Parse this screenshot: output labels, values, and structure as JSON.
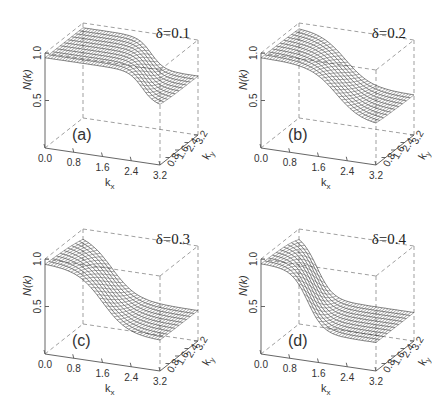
{
  "figure": {
    "panels": [
      {
        "id": "a",
        "label": "(a)",
        "delta": "δ=0.1"
      },
      {
        "id": "b",
        "label": "(b)",
        "delta": "δ=0.2"
      },
      {
        "id": "c",
        "label": "(c)",
        "delta": "δ=0.3"
      },
      {
        "id": "d",
        "label": "(d)",
        "delta": "δ=0.4"
      }
    ],
    "z_axis_label": "N(k)",
    "x_axis_label": "k",
    "x_axis_sub": "x",
    "y_axis_label": "k",
    "y_axis_sub": "y",
    "z_ticks": [
      "1.0",
      "0.5"
    ],
    "x_ticks": [
      "0.0",
      "0.8",
      "1.6",
      "2.4",
      "3.2"
    ],
    "y_ticks": [
      "0.8",
      "1.6",
      "2.4",
      "3.2"
    ]
  },
  "chart_data": [
    {
      "type": "surface",
      "title": "δ=0.1",
      "panel": "(a)",
      "xlabel": "k_x",
      "ylabel": "k_y",
      "zlabel": "N(k)",
      "xlim": [
        0,
        3.2
      ],
      "ylim": [
        0,
        3.2
      ],
      "zlim": [
        0,
        1.0
      ],
      "x_ticks": [
        0.0,
        0.8,
        1.6,
        2.4,
        3.2
      ],
      "y_ticks": [
        0.8,
        1.6,
        2.4,
        3.2
      ],
      "z_ticks": [
        0.5,
        1.0
      ],
      "description": "Momentum distribution ~0.95 over most of k-space with a sharp drop near k_x≈2.4–3.2 to ~0.6"
    },
    {
      "type": "surface",
      "title": "δ=0.2",
      "panel": "(b)",
      "xlabel": "k_x",
      "ylabel": "k_y",
      "zlabel": "N(k)",
      "xlim": [
        0,
        3.2
      ],
      "ylim": [
        0,
        3.2
      ],
      "zlim": [
        0,
        1.0
      ],
      "x_ticks": [
        0.0,
        0.8,
        1.6,
        2.4,
        3.2
      ],
      "y_ticks": [
        0.8,
        1.6,
        2.4,
        3.2
      ],
      "z_ticks": [
        0.5,
        1.0
      ],
      "description": "N(k)≈0.95 near k=0 decreasing smoothly with step near k_x≈2.0 to ~0.4"
    },
    {
      "type": "surface",
      "title": "δ=0.3",
      "panel": "(c)",
      "xlabel": "k_x",
      "ylabel": "k_y",
      "zlabel": "N(k)",
      "xlim": [
        0,
        3.2
      ],
      "ylim": [
        0,
        3.2
      ],
      "zlim": [
        0,
        1.0
      ],
      "x_ticks": [
        0.0,
        0.8,
        1.6,
        2.4,
        3.2
      ],
      "y_ticks": [
        0.8,
        1.6,
        2.4,
        3.2
      ],
      "z_ticks": [
        0.5,
        1.0
      ],
      "description": "N(k)≈0.95 near k=0 with drop centered near k_x≈1.6 to ~0.3"
    },
    {
      "type": "surface",
      "title": "δ=0.4",
      "panel": "(d)",
      "xlabel": "k_x",
      "ylabel": "k_y",
      "zlabel": "N(k)",
      "xlim": [
        0,
        3.2
      ],
      "ylim": [
        0,
        3.2
      ],
      "zlim": [
        0,
        1.0
      ],
      "x_ticks": [
        0.0,
        0.8,
        1.6,
        2.4,
        3.2
      ],
      "y_ticks": [
        0.8,
        1.6,
        2.4,
        3.2
      ],
      "z_ticks": [
        0.5,
        1.0
      ],
      "description": "N(k)≈0.95 near k=0 with sharp drop near k_x≈1.2 to ~0.3"
    }
  ]
}
